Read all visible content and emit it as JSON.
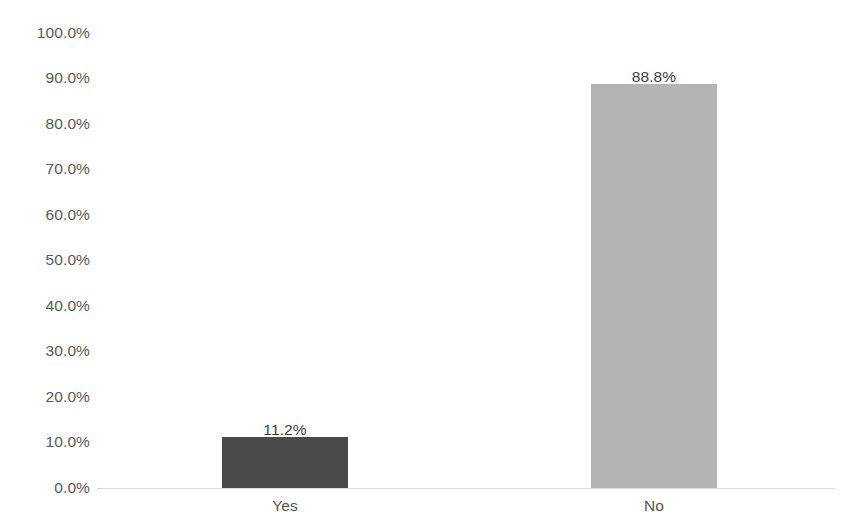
{
  "chart_data": {
    "type": "bar",
    "title": "",
    "subtitle": "",
    "xlabel": "",
    "ylabel": "",
    "categories": [
      "Yes",
      "No"
    ],
    "values": [
      11.2,
      88.8
    ],
    "data_labels": [
      "11.2%",
      "88.8%"
    ],
    "series": [
      {
        "name": "",
        "values": [
          11.2,
          88.8
        ]
      }
    ],
    "ylim": [
      0,
      100
    ],
    "y_tick_step": 10,
    "y_tick_labels": [
      "100.0%",
      "90.0%",
      "80.0%",
      "70.0%",
      "60.0%",
      "50.0%",
      "40.0%",
      "30.0%",
      "20.0%",
      "10.0%",
      "0.0%"
    ],
    "y_tick_values": [
      100,
      90,
      80,
      70,
      60,
      50,
      40,
      30,
      20,
      10,
      0
    ],
    "grid": false,
    "legend": false,
    "legend_position": "none",
    "bar_colors": [
      "#4a4a4a",
      "#b4b4b4"
    ],
    "axis_color": "#d8d8d8",
    "background_color": "#ffffff",
    "label_color": "#404040",
    "tick_color": "#5a5a5a",
    "annotations": []
  },
  "axis": {
    "y_labels": [
      "100.0%",
      "90.0%",
      "80.0%",
      "70.0%",
      "60.0%",
      "50.0%",
      "40.0%",
      "30.0%",
      "20.0%",
      "10.0%",
      "0.0%"
    ],
    "x_labels": [
      "Yes",
      "No"
    ]
  },
  "bars": [
    {
      "category": "Yes",
      "value_label": "11.2%"
    },
    {
      "category": "No",
      "value_label": "88.8%"
    }
  ]
}
